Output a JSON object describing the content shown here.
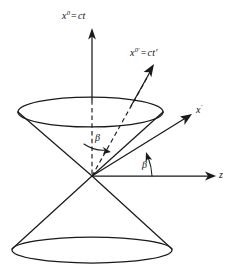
{
  "figure": {
    "name": "light-cone-minkowski-diagram",
    "background_color": "#ffffff",
    "ink_color": "#1a1a1a"
  },
  "labels": {
    "ct_axis": {
      "base": "x",
      "sup": "0",
      "equals": "=",
      "value": "ct"
    },
    "ct_prime_axis": {
      "base": "x",
      "sup": "0'",
      "equals": "=",
      "value": "ct'"
    },
    "x_prime_axis": {
      "base": "x",
      "sup": "'"
    },
    "z_axis": {
      "base": "z"
    },
    "angle_upper": "β",
    "angle_lower": "β"
  },
  "geometry": {
    "origin": {
      "x": 92,
      "y": 176
    },
    "upper_ellipse": {
      "cx": 90.5,
      "cy": 112,
      "rx": 72.5,
      "ry": 15
    },
    "lower_ellipse": {
      "cx": 92,
      "cy": 250,
      "rx": 80,
      "ry": 13
    },
    "ct_axis_tip": {
      "x": 92,
      "y": 30
    },
    "ct_prime_axis_tip": {
      "x": 152,
      "y": 68
    },
    "x_prime_axis_tip": {
      "x": 188,
      "y": 116
    },
    "z_axis_tip": {
      "x": 215,
      "y": 176
    }
  }
}
